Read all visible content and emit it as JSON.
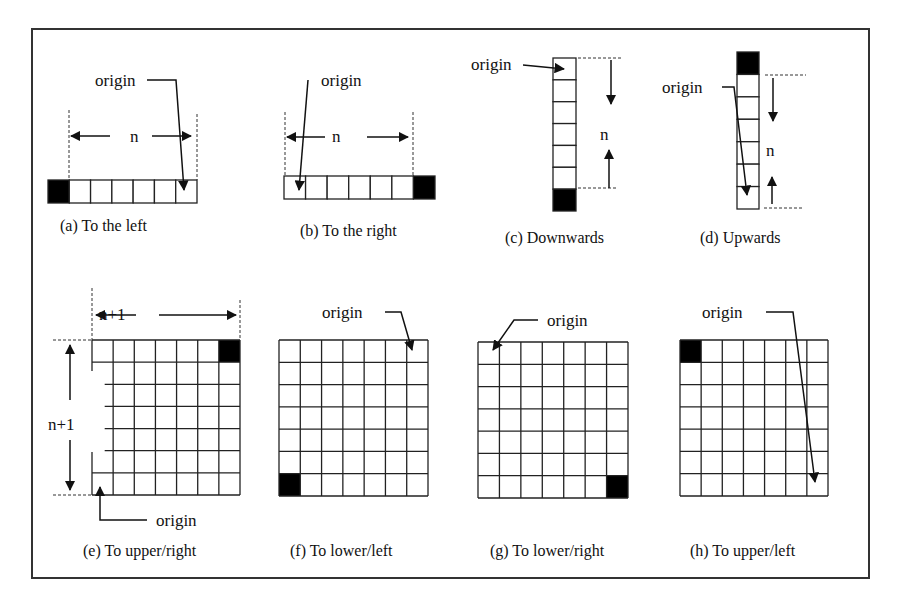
{
  "figure": {
    "frame": {
      "x": 32,
      "y": 29,
      "w": 837,
      "h": 549,
      "stroke": "#333333"
    },
    "colors": {
      "line": "#222222",
      "fill_black": "#000000",
      "bg": "#ffffff"
    },
    "panels": [
      {
        "id": "a",
        "caption": "(a) To the left",
        "caption_pos": [
          60,
          231
        ],
        "shape": "row",
        "cells": 7,
        "box": [
          48,
          180,
          149,
          23
        ],
        "black_index": 0,
        "origin_label": "origin",
        "origin_label_pos": [
          95,
          86
        ],
        "origin_leader": [
          [
            147,
            80
          ],
          [
            176,
            80
          ],
          [
            184,
            190
          ]
        ],
        "dimension_label": "n",
        "dimension_label_pos": [
          130,
          142
        ],
        "dim_orientation": "horizontal",
        "dim_guides": [
          [
            69,
            110,
            69,
            180
          ],
          [
            197,
            114,
            197,
            180
          ]
        ],
        "dim_arrows": [
          [
            110,
            136,
            71,
            136
          ],
          [
            152,
            136,
            191,
            136
          ]
        ]
      },
      {
        "id": "b",
        "caption": "(b) To the right",
        "caption_pos": [
          300,
          236
        ],
        "shape": "row",
        "cells": 7,
        "box": [
          284,
          176,
          151,
          23
        ],
        "black_index": 6,
        "origin_label": "origin",
        "origin_label_pos": [
          321,
          86
        ],
        "origin_leader": [
          [
            308,
            80
          ],
          [
            299,
            190
          ]
        ],
        "dimension_label": "n",
        "dimension_label_pos": [
          332,
          142
        ],
        "dim_orientation": "horizontal",
        "dim_guides": [
          [
            285,
            112,
            285,
            176
          ],
          [
            413,
            112,
            413,
            176
          ]
        ],
        "dim_arrows": [
          [
            325,
            137,
            287,
            137
          ],
          [
            367,
            137,
            408,
            137
          ]
        ]
      },
      {
        "id": "c",
        "caption": "(c) Downwards",
        "caption_pos": [
          505,
          243
        ],
        "shape": "col",
        "cells": 7,
        "box": [
          553,
          58,
          23,
          153
        ],
        "black_index": 6,
        "origin_label": "origin",
        "origin_label_pos": [
          471,
          70
        ],
        "origin_leader": [
          [
            523,
            65
          ],
          [
            564,
            69
          ]
        ],
        "dimension_label": "n",
        "dimension_label_pos": [
          600,
          140
        ],
        "dim_orientation": "vertical",
        "dim_guides": [
          [
            578,
            58,
            621,
            58
          ],
          [
            578,
            188,
            618,
            188
          ]
        ],
        "dim_arrows": [
          [
            611,
            60,
            611,
            104
          ],
          [
            609,
            188,
            609,
            150
          ]
        ]
      },
      {
        "id": "d",
        "caption": "(d) Upwards",
        "caption_pos": [
          700,
          243
        ],
        "shape": "col",
        "cells": 7,
        "box": [
          737,
          52,
          22,
          157
        ],
        "black_index": 0,
        "origin_label": "origin",
        "origin_label_pos": [
          662,
          93
        ],
        "origin_leader": [
          [
            722,
            87
          ],
          [
            734,
            87
          ],
          [
            747,
            195
          ]
        ],
        "dimension_label": "n",
        "dimension_label_pos": [
          766,
          156
        ],
        "dim_orientation": "vertical",
        "dim_guides": [
          [
            765,
            75,
            806,
            75
          ],
          [
            764,
            208,
            804,
            208
          ]
        ],
        "dim_arrows": [
          [
            773,
            78,
            773,
            121
          ],
          [
            772,
            204,
            772,
            177
          ]
        ]
      },
      {
        "id": "e",
        "caption": "(e) To upper/right",
        "caption_pos": [
          83,
          556
        ],
        "shape": "grid",
        "cells": 7,
        "box": [
          92,
          340,
          148,
          155
        ],
        "black_cell": [
          0,
          6
        ],
        "origin_label": "origin",
        "origin_label_pos": [
          156,
          526
        ],
        "origin_leader": [
          [
            147,
            520
          ],
          [
            100,
            520
          ],
          [
            100,
            487
          ]
        ],
        "dimension_label": "n+1",
        "dimension_label_pos": [
          99,
          320
        ],
        "dim_orientation": "both",
        "dimension_label_v": "n+1",
        "dimension_label_v_pos": [
          48,
          430
        ],
        "dim_guides": [
          [
            92,
            288,
            92,
            340
          ],
          [
            240,
            300,
            240,
            340
          ],
          [
            53,
            340,
            92,
            340
          ],
          [
            53,
            495,
            92,
            495
          ]
        ],
        "dim_arrows": [
          [
            136,
            315,
            96,
            315
          ],
          [
            159,
            315,
            236,
            315
          ],
          [
            70,
            400,
            70,
            345
          ],
          [
            70,
            440,
            70,
            490
          ]
        ],
        "left_gap": [
          371,
          452
        ]
      },
      {
        "id": "f",
        "caption": "(f) To lower/left",
        "caption_pos": [
          290,
          556
        ],
        "shape": "grid",
        "cells": 7,
        "box": [
          279,
          340,
          149,
          156
        ],
        "black_cell": [
          6,
          0
        ],
        "origin_label": "origin",
        "origin_label_pos": [
          322,
          318
        ],
        "origin_leader": [
          [
            385,
            312
          ],
          [
            401,
            312
          ],
          [
            412,
            350
          ]
        ],
        "dimension_label": "",
        "dim_orientation": "none"
      },
      {
        "id": "g",
        "caption": "(g) To lower/right",
        "caption_pos": [
          490,
          556
        ],
        "shape": "grid",
        "cells": 7,
        "box": [
          478,
          342,
          150,
          156
        ],
        "black_cell": [
          6,
          6
        ],
        "origin_label": "origin",
        "origin_label_pos": [
          547,
          326
        ],
        "origin_leader": [
          [
            538,
            320
          ],
          [
            514,
            320
          ],
          [
            493,
            350
          ]
        ],
        "dimension_label": "",
        "dim_orientation": "none"
      },
      {
        "id": "h",
        "caption": "(h) To upper/left",
        "caption_pos": [
          690,
          556
        ],
        "shape": "grid",
        "cells": 7,
        "box": [
          680,
          340,
          148,
          156
        ],
        "black_cell": [
          0,
          0
        ],
        "origin_label": "origin",
        "origin_label_pos": [
          702,
          318
        ],
        "origin_leader": [
          [
            766,
            312
          ],
          [
            793,
            312
          ],
          [
            815,
            482
          ]
        ],
        "dimension_label": "",
        "dim_orientation": "none"
      }
    ]
  }
}
